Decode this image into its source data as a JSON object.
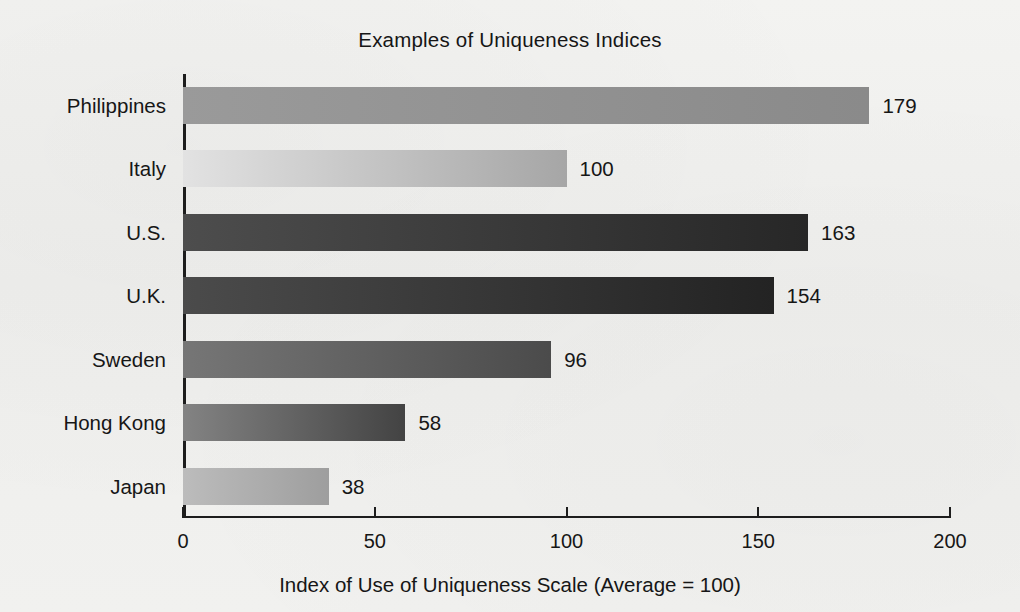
{
  "figure": {
    "background_color": "#f1f1ef",
    "text_color": "#161616",
    "axis_color": "#1d1d1d"
  },
  "chart_data": {
    "type": "bar",
    "orientation": "horizontal",
    "title": "Examples of Uniqueness Indices",
    "xlabel": "Index of Use of Uniqueness Scale (Average = 100)",
    "ylabel": "",
    "categories": [
      "Philippines",
      "Italy",
      "U.S.",
      "U.K.",
      "Sweden",
      "Hong Kong",
      "Japan"
    ],
    "values": [
      179,
      100,
      163,
      154,
      96,
      58,
      38
    ],
    "value_labels": [
      "179",
      "100",
      "163",
      "154",
      "96",
      "58",
      "38"
    ],
    "xlim": [
      0,
      200
    ],
    "xticks": [
      0,
      50,
      100,
      150,
      200
    ],
    "xtick_labels": [
      "0",
      "50",
      "100",
      "150",
      "200"
    ],
    "grid": false,
    "legend": null,
    "bar_colors": [
      {
        "from": "#9a9a9a",
        "to": "#8a8a8a"
      },
      {
        "from": "#e2e2e2",
        "to": "#a6a6a6"
      },
      {
        "from": "#4d4d4d",
        "to": "#272727"
      },
      {
        "from": "#4b4b4b",
        "to": "#232323"
      },
      {
        "from": "#767676",
        "to": "#4b4b4b"
      },
      {
        "from": "#838383",
        "to": "#434343"
      },
      {
        "from": "#bcbcbc",
        "to": "#9e9e9e"
      }
    ]
  }
}
